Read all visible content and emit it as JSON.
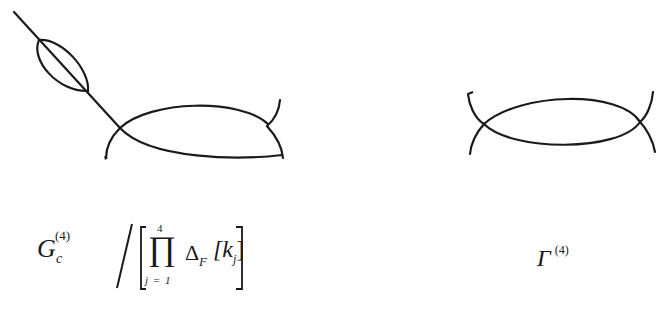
{
  "diagrams": [
    {
      "id": "left",
      "description": "Four-point vertex (fish/loop diagram) with self-energy bubble insertion on one external leg",
      "formula": {
        "symbol": "G",
        "subscript": "c",
        "superscript": "(4)",
        "divider": "/",
        "product_upper": "4",
        "product_symbol": "∏",
        "product_lower": "j = 1",
        "delta": "Δ",
        "delta_subscript": "F",
        "argument": "[k",
        "argument_subscript": "j",
        "argument_close": "]"
      }
    },
    {
      "id": "right",
      "description": "Amputated one-particle-irreducible four-point vertex (fish diagram)",
      "formula": {
        "symbol": "Γ",
        "superscript": "(4)"
      }
    }
  ],
  "colors": {
    "ink": "#1a1a1a",
    "background": "#ffffff"
  }
}
